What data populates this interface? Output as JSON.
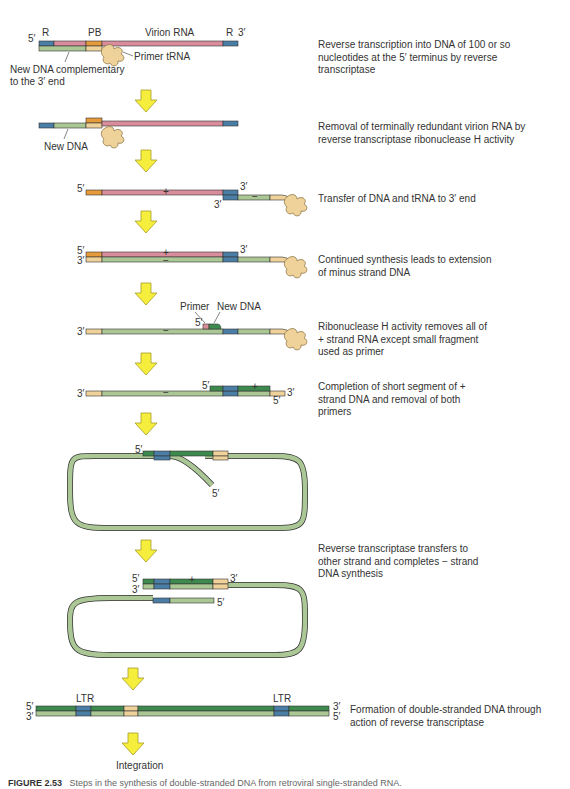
{
  "colors": {
    "rna": "#d98c9b",
    "r_region": "#4a7ea5",
    "pb_region": "#e59a3c",
    "new_dna_minus": "#aac795",
    "new_dna_plus": "#3e8a4e",
    "trna": "#efd19a",
    "primer_end": "#f2d59e",
    "arrow": "#f6ee3c",
    "arrow_stroke": "#a89c2a"
  },
  "step1": {
    "label_5": "5′",
    "label_3": "3′",
    "label_r_left": "R",
    "label_pb": "PB",
    "label_virion": "Virion RNA",
    "label_r_right": "R",
    "label_primer_trna": "Primer tRNA",
    "label_new_dna_line1": "New DNA complementary",
    "label_new_dna_line2": "to the 3′ end",
    "plus": "+",
    "description": "Reverse transcription into DNA of 100 or so nucleotides at the 5′ terminus by reverse transcriptase"
  },
  "step2": {
    "label_new_dna": "New DNA",
    "description": "Removal of terminally redundant virion RNA by reverse transcriptase ribonuclease H activity"
  },
  "step3": {
    "label_5": "5′",
    "label_3_top": "3′",
    "label_3_bottom": "3′",
    "plus": "+",
    "minus": "−",
    "description": "Transfer of DNA and tRNA to 3′ end"
  },
  "step4": {
    "label_5": "5′",
    "label_3_left": "3′",
    "label_3_right": "3′",
    "plus": "+",
    "minus": "−",
    "description": "Continued synthesis leads to extension of minus strand DNA"
  },
  "step5": {
    "label_primer": "Primer",
    "label_new_dna": "New DNA",
    "label_5": "5′",
    "label_3": "3′",
    "minus": "−",
    "description": "Ribonuclease H activity removes all of + strand RNA except small fragment used as primer"
  },
  "step6": {
    "label_3_left": "3′",
    "label_5_top": "5′",
    "label_3_right": "3′",
    "label_5_bottom": "5′",
    "minus": "−",
    "plus": "+",
    "description": "Completion of short segment of + strand DNA and removal of both primers"
  },
  "step7": {
    "label_5_top": "5′",
    "label_5_tail": "5′"
  },
  "step8": {
    "label_5": "5′",
    "label_3_left": "3′",
    "label_3_right": "3′",
    "label_5_right": "5′",
    "plus": "+",
    "description": "Reverse transcriptase transfers to other strand and completes − strand DNA synthesis"
  },
  "step9": {
    "label_5_left": "5′",
    "label_3_left": "3′",
    "label_3_right": "3′",
    "label_5_right": "5′",
    "label_ltr_left": "LTR",
    "label_ltr_right": "LTR",
    "description": "Formation of double-stranded DNA through action of reverse transcriptase"
  },
  "final": {
    "label": "Integration"
  },
  "caption": {
    "figure_number": "FIGURE 2.53",
    "text": "Steps in the synthesis of double-stranded DNA from retroviral single-stranded RNA."
  }
}
